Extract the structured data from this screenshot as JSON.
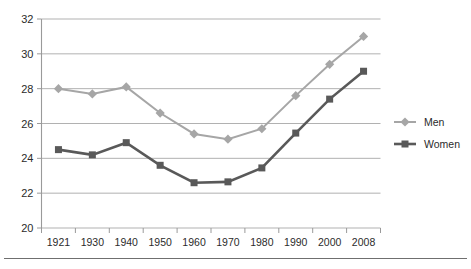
{
  "chart_data": {
    "type": "line",
    "title": "",
    "subtitle": "",
    "xlabel": "",
    "ylabel": "",
    "categories": [
      "1921",
      "1930",
      "1940",
      "1950",
      "1960",
      "1970",
      "1980",
      "1990",
      "2000",
      "2008"
    ],
    "series": [
      {
        "name": "Men",
        "color": "#a6a6a6",
        "marker": "diamond",
        "values": [
          28.0,
          27.7,
          28.1,
          26.6,
          25.4,
          25.1,
          25.7,
          27.6,
          29.4,
          31.0
        ]
      },
      {
        "name": "Women",
        "color": "#595959",
        "marker": "square",
        "values": [
          24.5,
          24.2,
          24.9,
          23.6,
          22.6,
          22.65,
          23.45,
          25.45,
          27.4,
          29.0
        ]
      }
    ],
    "ylim": [
      20,
      32
    ],
    "yticks": [
      20,
      22,
      24,
      26,
      28,
      30,
      32
    ],
    "ytick_labels": [
      "20",
      "22",
      "24",
      "26",
      "28",
      "30",
      "32"
    ],
    "grid": true,
    "grid_axis": "y",
    "legend_position": "right",
    "legend_entries": [
      "Men",
      "Women"
    ]
  },
  "axes": {
    "y_axis_name": "y-axis",
    "x_axis_name": "x-axis"
  },
  "colors": {
    "men": "#a6a6a6",
    "women": "#595959",
    "grid": "#a8a8a8",
    "axis": "#9a9a9a",
    "text": "#2b2b2b",
    "background": "#ffffff",
    "footer_rule": "#6f6f6f"
  }
}
